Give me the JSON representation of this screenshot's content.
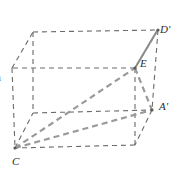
{
  "figure": {
    "background_color": "#ffffff",
    "width": 177,
    "height": 176,
    "labels": {
      "d_prime": "D'",
      "e": "E",
      "a_prime": "A'",
      "c": "C",
      "clipped_left": "a"
    },
    "colors": {
      "edge_dashed": "#6b6b6b",
      "highlight_dashed": "#9a9a9a",
      "solid_segment": "#8a8a8a",
      "label_text": "#2b2b2b"
    },
    "geometry": {
      "type": "rectangular-prism",
      "vertices": {
        "front_bottom_left": [
          15,
          148
        ],
        "front_bottom_right": [
          135,
          145
        ],
        "front_top_left": [
          12,
          68
        ],
        "front_top_right": [
          135,
          68
        ],
        "back_bottom_left": [
          33,
          113
        ],
        "back_bottom_right": [
          152,
          110
        ],
        "back_top_left": [
          33,
          32
        ],
        "back_top_right": [
          158,
          30
        ]
      },
      "named_points": {
        "C": [
          15,
          148
        ],
        "E": [
          135,
          68
        ],
        "A_prime": [
          152,
          110
        ],
        "D_prime": [
          158,
          30
        ]
      },
      "segments": [
        {
          "name": "C-to-E",
          "style": "thick-dashed-gray"
        },
        {
          "name": "C-to-A-prime",
          "style": "thick-dashed-gray"
        },
        {
          "name": "E-to-A-prime",
          "style": "thick-dashed-gray"
        },
        {
          "name": "E-to-D-prime",
          "style": "solid-gray"
        }
      ]
    }
  }
}
